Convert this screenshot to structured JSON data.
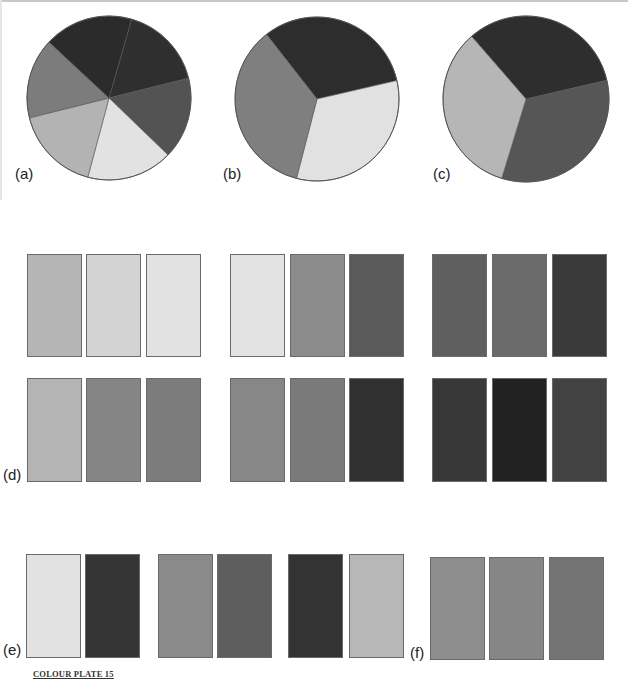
{
  "labels": {
    "a": "(a)",
    "b": "(b)",
    "c": "(c)",
    "d": "(d)",
    "e": "(e)",
    "f": "(f)"
  },
  "caption": "COLOUR PLATE 15",
  "chart_data": [
    {
      "type": "pie",
      "title": "(a)",
      "slices": [
        {
          "start_deg": 16,
          "end_deg": 76,
          "color": "#2f2f2f"
        },
        {
          "start_deg": 76,
          "end_deg": 134,
          "color": "#535353"
        },
        {
          "start_deg": 134,
          "end_deg": 195,
          "color": "#e2e2e2"
        },
        {
          "start_deg": 195,
          "end_deg": 256,
          "color": "#b3b3b3"
        },
        {
          "start_deg": 256,
          "end_deg": 313,
          "color": "#7c7c7c"
        },
        {
          "start_deg": 313,
          "end_deg": 376,
          "color": "#2b2b2b"
        }
      ],
      "values": [
        60,
        58,
        61,
        61,
        57,
        63
      ]
    },
    {
      "type": "pie",
      "title": "(b)",
      "slices": [
        {
          "start_deg": 322,
          "end_deg": 437,
          "color": "#2d2d2d"
        },
        {
          "start_deg": 77,
          "end_deg": 194.5,
          "color": "#e1e1e1"
        },
        {
          "start_deg": 194.5,
          "end_deg": 322,
          "color": "#7f7f7f"
        }
      ],
      "values": [
        115,
        117.5,
        127.5
      ]
    },
    {
      "type": "pie",
      "title": "(c)",
      "slices": [
        {
          "start_deg": 319,
          "end_deg": 437,
          "color": "#2e2e2e"
        },
        {
          "start_deg": 77,
          "end_deg": 197,
          "color": "#565656"
        },
        {
          "start_deg": 197,
          "end_deg": 319,
          "color": "#b6b6b6"
        }
      ],
      "values": [
        118,
        120,
        122
      ]
    },
    {
      "type": "table",
      "title": "(d)",
      "groups": [
        {
          "row1": [
            "#b5b5b5",
            "#d3d3d3",
            "#e2e2e2"
          ],
          "row2": [
            "#b4b4b4",
            "#858585",
            "#7c7c7c"
          ]
        },
        {
          "row1": [
            "#e3e3e3",
            "#8c8c8c",
            "#5a5a5a"
          ],
          "row2": [
            "#878787",
            "#7a7a7a",
            "#303030"
          ]
        },
        {
          "row1": [
            "#5f5f5f",
            "#6b6b6b",
            "#3a3a3a"
          ],
          "row2": [
            "#383838",
            "#222222",
            "#424242"
          ]
        }
      ]
    },
    {
      "type": "table",
      "title": "(e)",
      "pairs": [
        [
          "#e2e2e2",
          "#353535"
        ],
        [
          "#8a8a8a",
          "#5e5e5e"
        ],
        [
          "#333333",
          "#b7b7b7"
        ]
      ]
    },
    {
      "type": "table",
      "title": "(f)",
      "swatches": [
        "#8d8d8d",
        "#868686",
        "#747474"
      ]
    }
  ],
  "layout": {
    "pies": [
      {
        "cx": 109,
        "cy": 98,
        "r": 82
      },
      {
        "cx": 317,
        "cy": 99,
        "r": 82
      },
      {
        "cx": 526,
        "cy": 99,
        "r": 83
      }
    ],
    "d_rows": [
      {
        "top": 254,
        "height": 103
      },
      {
        "top": 378,
        "height": 104
      }
    ],
    "d_cols": [
      [
        27,
        86,
        146
      ],
      [
        230,
        290,
        349
      ],
      [
        432,
        492,
        552
      ]
    ],
    "d_width": 55,
    "e_top": 554,
    "e_height": 104,
    "e_cols": [
      26,
      85,
      158,
      217,
      288,
      349
    ],
    "f_top": 557,
    "f_height": 103,
    "f_cols": [
      430,
      489,
      549
    ],
    "sw_width": 55
  }
}
